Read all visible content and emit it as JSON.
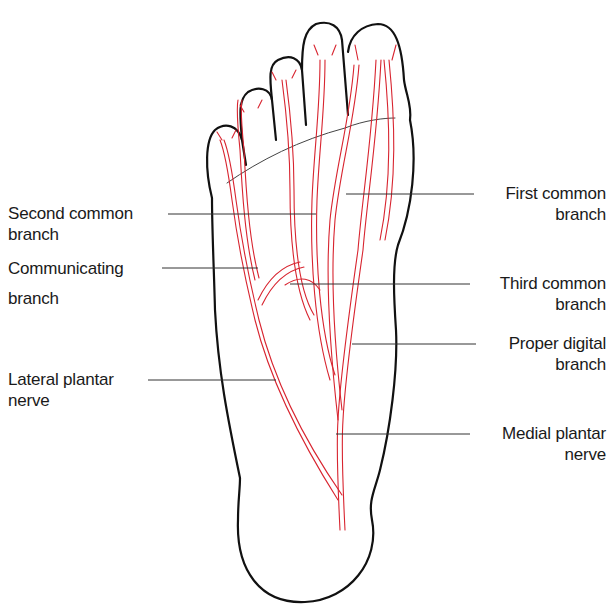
{
  "diagram": {
    "labels_left": [
      {
        "id": "second-common-branch",
        "line1": "Second common",
        "line2": "branch"
      },
      {
        "id": "communicating-branch",
        "line1": "Communicating",
        "line2": "branch"
      },
      {
        "id": "lateral-plantar-nerve",
        "line1": "Lateral plantar",
        "line2": "nerve"
      }
    ],
    "labels_right": [
      {
        "id": "first-common-branch",
        "line1": "First common",
        "line2": "branch"
      },
      {
        "id": "third-common-branch",
        "line1": "Third common",
        "line2": "branch"
      },
      {
        "id": "proper-digital-branch",
        "line1": "Proper digital",
        "line2": "branch"
      },
      {
        "id": "medial-plantar-nerve",
        "line1": "Medial plantar",
        "line2": "nerve"
      }
    ],
    "colors": {
      "outline": "#111111",
      "nerve": "#d8242f",
      "leader": "#333333",
      "background": "#ffffff"
    }
  }
}
